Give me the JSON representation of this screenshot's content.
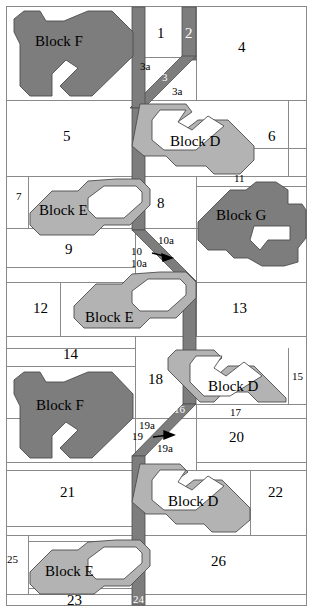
{
  "figure": {
    "width": 313,
    "height": 614,
    "colors": {
      "dark_block": "#7d7d7d",
      "light_block": "#b3b3b3",
      "outline": "#555555",
      "gridline": "#8a8a8a",
      "background": "#ffffff",
      "text": "#000000",
      "text_on_bar": "#ffffff"
    }
  },
  "blocks": [
    {
      "id": "block-f-top",
      "label": "Block F",
      "shade": "dark",
      "x": 62,
      "y": 42
    },
    {
      "id": "block-d-upper",
      "label": "Block D",
      "shade": "light",
      "x": 212,
      "y": 142
    },
    {
      "id": "block-e-upper",
      "label": "Block E",
      "shade": "light",
      "x": 70,
      "y": 211
    },
    {
      "id": "block-g",
      "label": "Block G",
      "shade": "dark",
      "x": 250,
      "y": 216
    },
    {
      "id": "block-e-mid",
      "label": "Block E",
      "shade": "light",
      "x": 116,
      "y": 318
    },
    {
      "id": "block-f-lower",
      "label": "Block F",
      "shade": "dark",
      "x": 63,
      "y": 406
    },
    {
      "id": "block-d-mid",
      "label": "Block D",
      "shade": "light",
      "x": 242,
      "y": 387
    },
    {
      "id": "block-d-lower",
      "label": "Block D",
      "shade": "light",
      "x": 202,
      "y": 502
    },
    {
      "id": "block-e-lower",
      "label": "Block E",
      "shade": "light",
      "x": 76,
      "y": 572
    }
  ],
  "region_labels": [
    {
      "id": "r1",
      "text": "1",
      "x": 160,
      "y": 33,
      "size": "num"
    },
    {
      "id": "r2",
      "text": "2",
      "x": 189,
      "y": 33,
      "size": "num",
      "on_bar": true
    },
    {
      "id": "r3a1",
      "text": "3a",
      "x": 146,
      "y": 67,
      "size": "num-sm"
    },
    {
      "id": "r3",
      "text": "3",
      "x": 166,
      "y": 78,
      "size": "num-sm",
      "on_bar": true
    },
    {
      "id": "r3a2",
      "text": "3a",
      "x": 180,
      "y": 91,
      "size": "num-sm"
    },
    {
      "id": "r4",
      "text": "4",
      "x": 242,
      "y": 47,
      "size": "num"
    },
    {
      "id": "r5",
      "text": "5",
      "x": 67,
      "y": 136,
      "size": "num"
    },
    {
      "id": "r6",
      "text": "6",
      "x": 272,
      "y": 136,
      "size": "num"
    },
    {
      "id": "r7",
      "text": "7",
      "x": 20,
      "y": 198,
      "size": "num-sm"
    },
    {
      "id": "r8",
      "text": "8",
      "x": 161,
      "y": 203,
      "size": "num"
    },
    {
      "id": "r9",
      "text": "9",
      "x": 69,
      "y": 249,
      "size": "num"
    },
    {
      "id": "r10",
      "text": "10",
      "x": 137,
      "y": 252,
      "size": "num-sm"
    },
    {
      "id": "r10a1",
      "text": "10a",
      "x": 164,
      "y": 242,
      "size": "num-sm"
    },
    {
      "id": "r10a2",
      "text": "10a",
      "x": 137,
      "y": 264,
      "size": "num-sm"
    },
    {
      "id": "r11",
      "text": "11",
      "x": 238,
      "y": 180,
      "size": "num-sm"
    },
    {
      "id": "r12",
      "text": "12",
      "x": 38,
      "y": 308,
      "size": "num"
    },
    {
      "id": "r13",
      "text": "13",
      "x": 237,
      "y": 308,
      "size": "num"
    },
    {
      "id": "r14",
      "text": "14",
      "x": 68,
      "y": 354,
      "size": "num"
    },
    {
      "id": "r15",
      "text": "15",
      "x": 295,
      "y": 378,
      "size": "num-sm"
    },
    {
      "id": "r16",
      "text": "16",
      "x": 178,
      "y": 411,
      "size": "num-sm",
      "on_bar": true
    },
    {
      "id": "r17",
      "text": "17",
      "x": 235,
      "y": 414,
      "size": "num-sm"
    },
    {
      "id": "r18",
      "text": "18",
      "x": 152,
      "y": 380,
      "size": "num"
    },
    {
      "id": "r19",
      "text": "19",
      "x": 138,
      "y": 438,
      "size": "num-sm"
    },
    {
      "id": "r19a1",
      "text": "19a",
      "x": 145,
      "y": 427,
      "size": "num-sm"
    },
    {
      "id": "r19a2",
      "text": "19a",
      "x": 163,
      "y": 449,
      "size": "num-sm"
    },
    {
      "id": "r20",
      "text": "20",
      "x": 234,
      "y": 437,
      "size": "num"
    },
    {
      "id": "r21",
      "text": "21",
      "x": 65,
      "y": 492,
      "size": "num"
    },
    {
      "id": "r22",
      "text": "22",
      "x": 272,
      "y": 492,
      "size": "num"
    },
    {
      "id": "r23",
      "text": "23",
      "x": 72,
      "y": 600,
      "size": "num"
    },
    {
      "id": "r24",
      "text": "24",
      "x": 138,
      "y": 600,
      "size": "num-sm",
      "on_bar": true
    },
    {
      "id": "r25",
      "text": "25",
      "x": 10,
      "y": 561,
      "size": "num-sm"
    },
    {
      "id": "r26",
      "text": "26",
      "x": 216,
      "y": 562,
      "size": "num"
    }
  ],
  "callout_arrows": [
    {
      "id": "arrow-10",
      "x1": 152,
      "y1": 252,
      "x2": 170,
      "y2": 256
    },
    {
      "id": "arrow-19",
      "x1": 153,
      "y1": 438,
      "x2": 172,
      "y2": 435
    }
  ],
  "gridlines": {
    "horizontal": [
      6,
      57,
      100,
      148,
      176,
      186,
      228,
      267,
      282,
      336,
      348,
      366,
      404,
      418,
      462,
      470,
      526,
      535,
      594,
      606
    ],
    "vertical": [
      6,
      135,
      145,
      182,
      190,
      196,
      214,
      250,
      288,
      306
    ]
  }
}
